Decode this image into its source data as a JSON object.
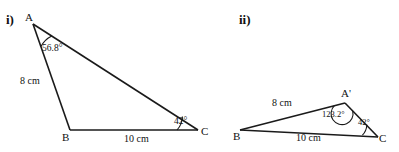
{
  "figure": {
    "background_color": "#ffffff",
    "stroke_color": "#1a1a1a",
    "text_color": "#111111"
  },
  "parts": [
    {
      "id": "part-i",
      "number_label": "i)",
      "vertices": [
        {
          "name": "A",
          "label": "A",
          "x": 33,
          "y": 24
        },
        {
          "name": "B",
          "label": "B",
          "x": 70,
          "y": 130
        },
        {
          "name": "C",
          "label": "C",
          "x": 198,
          "y": 130
        }
      ],
      "sides": [
        {
          "name": "AB",
          "label": "8 cm"
        },
        {
          "name": "BC",
          "label": "10 cm"
        }
      ],
      "angles": [
        {
          "vertex": "A",
          "label": "56.8°",
          "value": 56.8,
          "arc": "acute"
        },
        {
          "vertex": "C",
          "label": "42°",
          "value": 42,
          "arc": "acute"
        }
      ]
    },
    {
      "id": "part-ii",
      "number_label": "ii)",
      "vertices": [
        {
          "name": "B",
          "label": "B",
          "x": 240,
          "y": 130
        },
        {
          "name": "A-prime",
          "label": "A'",
          "x": 345,
          "y": 103
        },
        {
          "name": "C",
          "label": "C",
          "x": 378,
          "y": 137
        }
      ],
      "sides": [
        {
          "name": "BA-prime",
          "label": "8 cm"
        },
        {
          "name": "BC",
          "label": "10 cm"
        }
      ],
      "angles": [
        {
          "vertex": "A-prime",
          "label": "123.2°",
          "value": 123.2,
          "arc": "obtuse"
        },
        {
          "vertex": "C",
          "label": "42°",
          "value": 42,
          "arc": "acute"
        }
      ]
    }
  ]
}
